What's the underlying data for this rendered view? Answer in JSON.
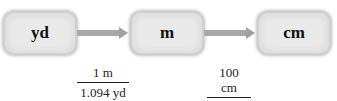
{
  "diagram": {
    "nodes": [
      {
        "id": "yd",
        "label": "yd"
      },
      {
        "id": "m",
        "label": "m"
      },
      {
        "id": "cm",
        "label": "cm"
      }
    ],
    "conversions": [
      {
        "from": "yd",
        "to": "m",
        "numerator": "1 m",
        "denominator": "1.094 yd"
      },
      {
        "from": "m",
        "to": "cm",
        "numerator": "100 cm",
        "denominator": "1 m"
      }
    ],
    "colors": {
      "box_fill": "#ececec",
      "box_border": "#cfcfcf",
      "arrow": "#a8a8a8",
      "text": "#111111"
    }
  }
}
